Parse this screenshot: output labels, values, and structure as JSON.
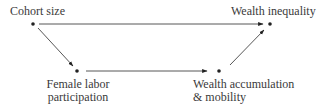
{
  "diagram": {
    "type": "causal-path-diagram",
    "colors": {
      "line": "#444444",
      "node": "#222222",
      "text": "#3a3a3a",
      "background": "#ffffff"
    },
    "nodes": [
      {
        "id": "cohort",
        "label": "Cohort size",
        "x": 33,
        "y": 24
      },
      {
        "id": "inequality",
        "label": "Wealth inequality",
        "x": 270,
        "y": 24
      },
      {
        "id": "female",
        "label_line1": "Female labor",
        "label_line2": "participation",
        "x": 77,
        "y": 71
      },
      {
        "id": "wealth",
        "label_line1": "Wealth accumulation",
        "label_line2": "& mobility",
        "x": 219,
        "y": 71
      }
    ],
    "edges": [
      {
        "from": "cohort",
        "to": "inequality"
      },
      {
        "from": "cohort",
        "to": "female"
      },
      {
        "from": "female",
        "to": "wealth"
      },
      {
        "from": "wealth",
        "to": "inequality"
      }
    ]
  }
}
